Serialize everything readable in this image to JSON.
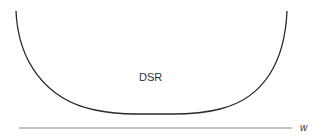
{
  "diagram": {
    "type": "u-shaped-curve",
    "curve_label": "DSR",
    "axis_label": "w",
    "colors": {
      "curve": "#2a2a2a",
      "axis": "#888888",
      "text": "#333333",
      "background": "#ffffff"
    }
  }
}
